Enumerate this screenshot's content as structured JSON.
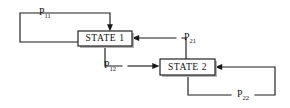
{
  "diagram": {
    "type": "state-transition-diagram",
    "background_color": "#ffffff",
    "line_color": "#1a1a1a",
    "text_color": "#111111",
    "states": [
      {
        "id": "state-1",
        "label": "STATE 1",
        "x": 78,
        "y": 31,
        "width": 54,
        "height": 15
      },
      {
        "id": "state-2",
        "label": "STATE 2",
        "x": 160,
        "y": 59,
        "width": 55,
        "height": 16
      }
    ],
    "transitions": [
      {
        "id": "p11",
        "label_base": "P",
        "label_sub": "11",
        "from": "state-1",
        "to": "state-1",
        "kind": "self-loop",
        "label_x": 45,
        "label_y": 13
      },
      {
        "id": "p12",
        "label_base": "P",
        "label_sub": "12",
        "from": "state-1",
        "to": "state-2",
        "kind": "forward",
        "label_x": 110,
        "label_y": 66
      },
      {
        "id": "p21",
        "label_base": "P",
        "label_sub": "21",
        "from": "state-2",
        "to": "state-1",
        "kind": "backward",
        "label_x": 190,
        "label_y": 38
      },
      {
        "id": "p22",
        "label_base": "P",
        "label_sub": "22",
        "from": "state-2",
        "to": "state-2",
        "kind": "self-loop",
        "label_x": 243,
        "label_y": 95
      }
    ]
  }
}
